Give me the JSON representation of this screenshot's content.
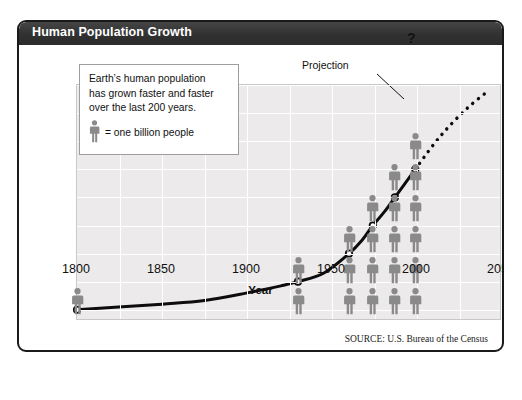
{
  "title": "Human Population Growth",
  "source": "SOURCE: U.S. Bureau of the Census",
  "note": {
    "line1": "Earth’s human population",
    "line2": "has  grown faster and faster",
    "line3": "over the last 200 years.",
    "legend_text": "= one billion people"
  },
  "annotations": {
    "projection": "Projection",
    "question": "?"
  },
  "colors": {
    "title_bar": "#323232",
    "plot_bg": "#eceaea",
    "grid": "#ffffff",
    "curve": "#0d0d0d",
    "figure": "#8a8a8a",
    "frame": "#1a1a1a"
  },
  "chart_data": {
    "type": "line",
    "title": "Human Population Growth",
    "xlabel": "Year",
    "ylabel": "Human Population (billions of people)",
    "xlim": [
      1800,
      2050
    ],
    "ylim": [
      0.6,
      9
    ],
    "xticks": [
      1800,
      1850,
      1900,
      1950,
      2000,
      2050
    ],
    "yticks": [
      1,
      2,
      3,
      4,
      5,
      6,
      7,
      8,
      9
    ],
    "grid": true,
    "legend_position": "none",
    "series": [
      {
        "name": "Observed population",
        "style": "solid",
        "x": [
          1800,
          1850,
          1875,
          1900,
          1920,
          1930,
          1945,
          1960,
          1968,
          1974,
          1981,
          1987,
          1993,
          1999
        ],
        "y": [
          1.0,
          1.2,
          1.33,
          1.6,
          1.85,
          2.0,
          2.3,
          3.0,
          3.5,
          4.0,
          4.5,
          5.0,
          5.5,
          6.0
        ]
      },
      {
        "name": "Projection",
        "style": "dotted",
        "x": [
          1999,
          2010,
          2020,
          2030,
          2040
        ],
        "y": [
          6.0,
          6.9,
          7.6,
          8.2,
          8.7
        ]
      }
    ],
    "markers": [
      {
        "year": 1800,
        "value": 1
      },
      {
        "year": 1930,
        "value": 2
      },
      {
        "year": 1960,
        "value": 3
      },
      {
        "year": 1974,
        "value": 4
      },
      {
        "year": 1987,
        "value": 5
      },
      {
        "year": 1999,
        "value": 6
      }
    ],
    "pictogram": {
      "unit": "one billion people",
      "columns": [
        {
          "year": 1800,
          "count": 1
        },
        {
          "year": 1930,
          "count": 2
        },
        {
          "year": 1960,
          "count": 3
        },
        {
          "year": 1974,
          "count": 4
        },
        {
          "year": 1987,
          "count": 5
        },
        {
          "year": 1999,
          "count": 6
        }
      ]
    },
    "annotations": [
      {
        "text": "Projection",
        "points_to": "dotted projection curve"
      },
      {
        "text": "?",
        "at": [
          2040,
          8.8
        ]
      }
    ]
  }
}
